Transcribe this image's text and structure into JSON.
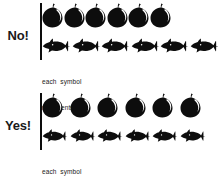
{
  "figure": {
    "ink_color": "#0d0d0d",
    "background_color": "#ffffff"
  },
  "panels": [
    {
      "id": "no",
      "verdict_label": "No!",
      "legend_line1": "each  symbol",
      "legend_line2": "represents 100",
      "rows": [
        {
          "id": "fruit",
          "symbol": "apple-icon",
          "count": 6,
          "symbol_width": 21,
          "symbol_height": 25,
          "gap": 0.5
        },
        {
          "id": "fish",
          "symbol": "fish-icon",
          "count": 6,
          "symbol_width": 29,
          "symbol_height": 22,
          "gap": 0.5
        }
      ]
    },
    {
      "id": "yes",
      "verdict_label": "Yes!",
      "legend_line1": "each  symbol",
      "legend_line2": "represents 100",
      "rows": [
        {
          "id": "fruit",
          "symbol": "apple-icon",
          "count": 6,
          "symbol_width": 21,
          "symbol_height": 25,
          "gap": 6.6
        },
        {
          "id": "fish",
          "symbol": "fish-icon",
          "count": 6,
          "symbol_width": 26,
          "symbol_height": 22,
          "gap": 1.6
        }
      ]
    }
  ],
  "chart_data": {
    "type": "bar",
    "title": "",
    "subtitle": "",
    "xlabel": "",
    "ylabel": "",
    "grid": false,
    "legend_position": "below-axis",
    "legend_text": "each symbol represents 100",
    "symbol_value": 100,
    "categories": [
      "fruit",
      "fish"
    ],
    "values": [
      600,
      600
    ],
    "series": [
      {
        "name": "No! (incorrect pictograph)",
        "categories": [
          "fruit",
          "fish"
        ],
        "symbol_counts": [
          6,
          6
        ],
        "values": [
          600,
          600
        ],
        "row_pixel_widths": [
          126,
          174
        ],
        "note": "Symbols differ in width so equal counts render as unequal bar lengths"
      },
      {
        "name": "Yes! (correct pictograph)",
        "categories": [
          "fruit",
          "fish"
        ],
        "symbol_counts": [
          6,
          6
        ],
        "values": [
          600,
          600
        ],
        "row_pixel_widths": [
          163,
          163
        ],
        "note": "Symbols occupy equal width so equal counts render as equal bar lengths"
      }
    ]
  }
}
